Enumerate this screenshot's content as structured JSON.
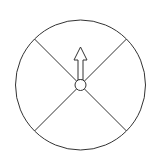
{
  "diagram": {
    "type": "spinner",
    "sections": 4,
    "pointer_direction": "up",
    "colors": {
      "background": "#ffffff",
      "stroke": "#333333"
    }
  }
}
